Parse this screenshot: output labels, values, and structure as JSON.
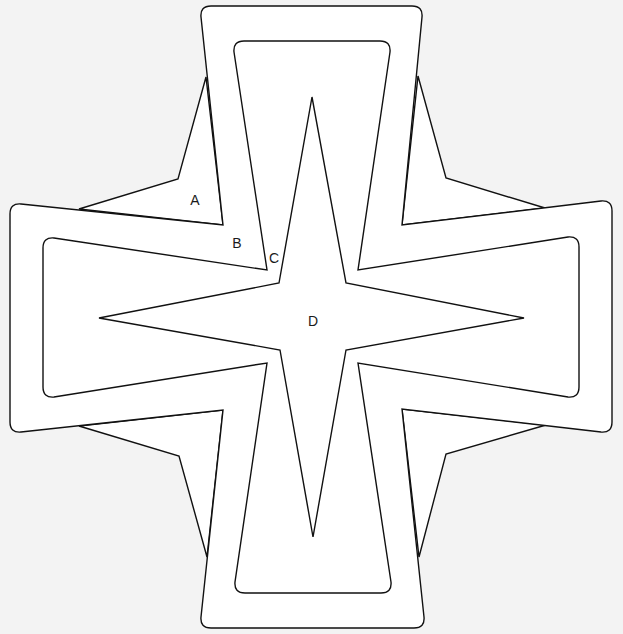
{
  "diagram": {
    "background_color": "#f3f3f3",
    "fill_color": "#ffffff",
    "stroke_color": "#111111",
    "labels": [
      {
        "id": "A",
        "text": "A",
        "x": 195,
        "y": 201
      },
      {
        "id": "B",
        "text": "B",
        "x": 237,
        "y": 244
      },
      {
        "id": "C",
        "text": "C",
        "x": 274,
        "y": 259
      },
      {
        "id": "D",
        "text": "D",
        "x": 313,
        "y": 322
      }
    ],
    "shapes": {
      "corner_triangles": [
        {
          "name": "top-left",
          "points": "206,77 178,179 79,209 223,225"
        },
        {
          "name": "top-right",
          "points": "418,76 446,178 545,208 402,225"
        },
        {
          "name": "bottom-left",
          "points": "79,426 179,456 207,557 223,410"
        },
        {
          "name": "bottom-right",
          "points": "546,425 446,454 419,557 402,409"
        }
      ],
      "outer_cross": "M 211,6 L 412,6 Q 423,6 422,17 L 402,225 L 601,201 Q 612,200 612,211 L 612,422 Q 612,433 601,432 L 402,409 L 424,617 Q 425,628 414,628 L 211,628 Q 200,628 201,617 L 223,410 L 21,432 Q 10,433 10,422 L 10,214 Q 10,203 21,204 L 223,225 L 201,17 Q 200,6 211,6 Z",
      "inner_cross": "M 244,41 L 380,41 Q 391,41 390,52 L 358,270 L 568,237 Q 579,236 579,247 L 579,387 Q 579,398 568,397 L 358,363 L 391,582 Q 392,593 381,593 L 245,593 Q 234,593 235,582 L 267,363 L 54,397 Q 43,398 43,387 L 43,248 Q 43,237 54,238 L 267,270 L 234,52 Q 233,41 244,41 Z",
      "center_star": "312,97 346,283 524,318 346,350 313,537 280,350 99,318 279,283"
    }
  }
}
